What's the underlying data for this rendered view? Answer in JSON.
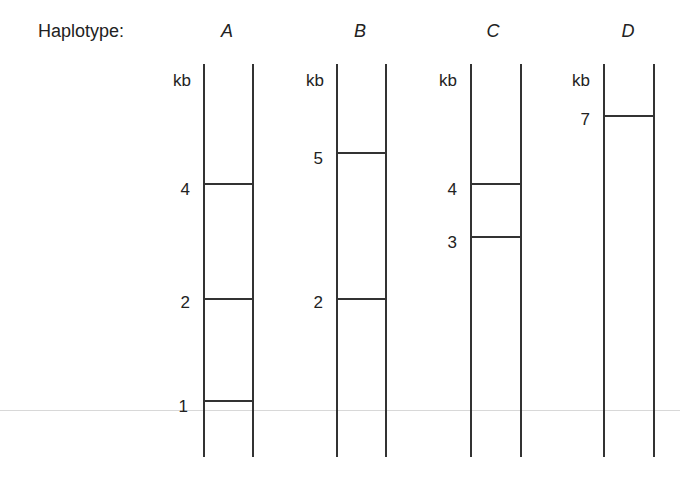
{
  "header": {
    "label": "Haplotype:"
  },
  "unit_label": "kb",
  "lanes": [
    {
      "name": "A",
      "bands": [
        {
          "size": "4"
        },
        {
          "size": "2"
        },
        {
          "size": "1"
        }
      ]
    },
    {
      "name": "B",
      "bands": [
        {
          "size": "5"
        },
        {
          "size": "2"
        }
      ]
    },
    {
      "name": "C",
      "bands": [
        {
          "size": "4"
        },
        {
          "size": "3"
        }
      ]
    },
    {
      "name": "D",
      "bands": [
        {
          "size": "7"
        }
      ]
    }
  ],
  "colors": {
    "line": "#333333",
    "background": "#ffffff"
  }
}
